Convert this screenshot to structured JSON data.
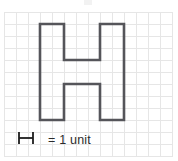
{
  "figure": {
    "title": ""
  },
  "grid": {
    "columns": 14,
    "rows": 12,
    "cell_size_px": 12,
    "line_color": "#e3e3e3",
    "border_color": "#e0e0e0",
    "background": "#ffffff",
    "show_grid": true
  },
  "shape": {
    "name": "H",
    "stroke_color": "#55555a",
    "stroke_width_px": 2.6,
    "fill": "none",
    "units_wide": 7,
    "units_tall": 8,
    "vertices_units": [
      [
        3,
        1
      ],
      [
        5,
        1
      ],
      [
        5,
        4
      ],
      [
        8,
        4
      ],
      [
        8,
        1
      ],
      [
        10,
        1
      ],
      [
        10,
        9
      ],
      [
        8,
        9
      ],
      [
        8,
        6
      ],
      [
        5,
        6
      ],
      [
        5,
        9
      ],
      [
        3,
        9
      ]
    ]
  },
  "legend": {
    "symbol_name": "unit-length-marker",
    "symbol_shape": "H",
    "equals": "=",
    "value": "1",
    "unit": "unit",
    "text": "= 1 unit",
    "full_text": "H = 1 unit",
    "symbol_color": "#1c1c1c",
    "text_color": "#2b2b2b"
  },
  "chart_data": {
    "type": "table",
    "xlabel": "",
    "ylabel": "",
    "categories": [
      "grid_columns",
      "grid_rows",
      "shape_width_units",
      "shape_height_units",
      "legend_unit_value"
    ],
    "values": [
      14,
      12,
      7,
      8,
      1
    ]
  }
}
